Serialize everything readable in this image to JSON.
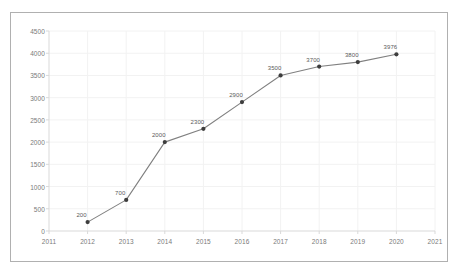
{
  "chart_data": {
    "type": "line",
    "title": "",
    "subtitle": "",
    "xlabel": "",
    "ylabel": "",
    "x": [
      2012,
      2013,
      2014,
      2015,
      2016,
      2017,
      2018,
      2019,
      2020
    ],
    "values": [
      200,
      700,
      2000,
      2300,
      2900,
      3500,
      3700,
      3800,
      3976
    ],
    "point_labels": [
      "200",
      "700",
      "2000",
      "2300",
      "2900",
      "3500",
      "3700",
      "3800",
      "3976"
    ],
    "xlim": [
      2011,
      2021
    ],
    "ylim": [
      0,
      4500
    ],
    "x_tick_labels": [
      "2011",
      "2012",
      "2013",
      "2014",
      "2015",
      "2016",
      "2017",
      "2018",
      "2019",
      "2020",
      "2021"
    ],
    "x_ticks": [
      2011,
      2012,
      2013,
      2014,
      2015,
      2016,
      2017,
      2018,
      2019,
      2020,
      2021
    ],
    "y_tick_labels": [
      "0",
      "500",
      "1000",
      "1500",
      "2000",
      "2500",
      "3000",
      "3500",
      "4000",
      "4500"
    ],
    "y_ticks": [
      0,
      500,
      1000,
      1500,
      2000,
      2500,
      3000,
      3500,
      4000,
      4500
    ],
    "grid": true,
    "legend": [],
    "legend_position": "none",
    "line_color": "#808080",
    "marker_color": "#3d3d3d",
    "grid_color": "#f2f2f2",
    "axis_color": "#d9d9d9",
    "tick_text_color": "#7a7a7a",
    "label_text_color": "#5a5a5a",
    "frame_color": "#b0b0b0",
    "background_color": "#ffffff"
  }
}
